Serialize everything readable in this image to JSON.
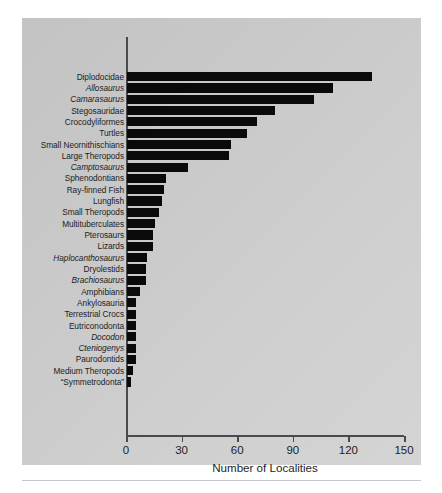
{
  "chart_data": {
    "type": "bar",
    "orientation": "horizontal",
    "title": "",
    "xlabel": "Number of Localities",
    "ylabel": "",
    "xlim": [
      0,
      150
    ],
    "xticks": [
      0,
      30,
      60,
      90,
      120,
      150
    ],
    "grid": false,
    "legend": null,
    "bar_color": "#0a0a0a",
    "panel_color": "#cccccc",
    "categories": [
      "Diplodocidae",
      "Allosaurus",
      "Camarasaurus",
      "Stegosauridae",
      "Crocodyliformes",
      "Turtles",
      "Small Neornithischians",
      "Large Theropods",
      "Camptosaurus",
      "Sphenodontians",
      "Ray-finned Fish",
      "Lungfish",
      "Small Theropods",
      "Multituberculates",
      "Pterosaurs",
      "Lizards",
      "Haplocanthosaurus",
      "Dryolestids",
      "Brachiosaurus",
      "Amphibians",
      "Ankylosauria",
      "Terrestrial Crocs",
      "Eutriconodonta",
      "Docodon",
      "Cteniogenys",
      "Paurodontids",
      "Medium Theropods",
      "“Symmetrodonta”"
    ],
    "values": [
      132,
      111,
      101,
      80,
      70,
      65,
      56,
      55,
      33,
      21,
      20,
      19,
      17,
      15,
      14,
      14,
      11,
      10,
      10,
      7,
      5,
      5,
      5,
      5,
      5,
      5,
      3,
      2
    ],
    "italic_categories": [
      "Allosaurus",
      "Camarasaurus",
      "Camptosaurus",
      "Haplocanthosaurus",
      "Brachiosaurus",
      "Docodon",
      "Cteniogenys"
    ]
  }
}
